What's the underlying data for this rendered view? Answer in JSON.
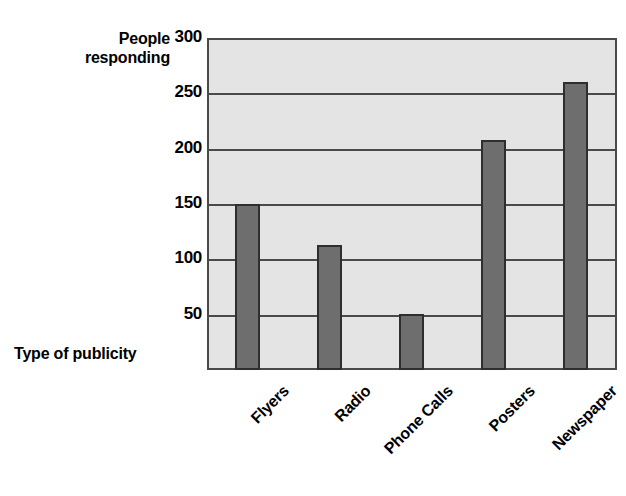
{
  "chart_data": {
    "type": "bar",
    "title": "",
    "xlabel": "Type of publicity",
    "ylabel": "People responding",
    "categories": [
      "Flyers",
      "Radio",
      "Phone Calls",
      "Posters",
      "Newspaper"
    ],
    "values": [
      152,
      115,
      52,
      210,
      262
    ],
    "ylim": [
      0,
      300
    ],
    "yticks": [
      50,
      100,
      150,
      200,
      250,
      300
    ],
    "ytick_labels": [
      "50",
      "100",
      "150",
      "200",
      "250",
      "300"
    ],
    "grid": true,
    "legend": "none",
    "bar_color": "#6e6e6e",
    "bar_border_color": "#2e2e2e",
    "plot_background": "#e4e4e4",
    "axis_color": "#4a4a4a",
    "text_color": "#000000"
  },
  "axes": {
    "y_title_line1": "People",
    "y_title_line2": "responding",
    "x_title": "Type of publicity"
  }
}
